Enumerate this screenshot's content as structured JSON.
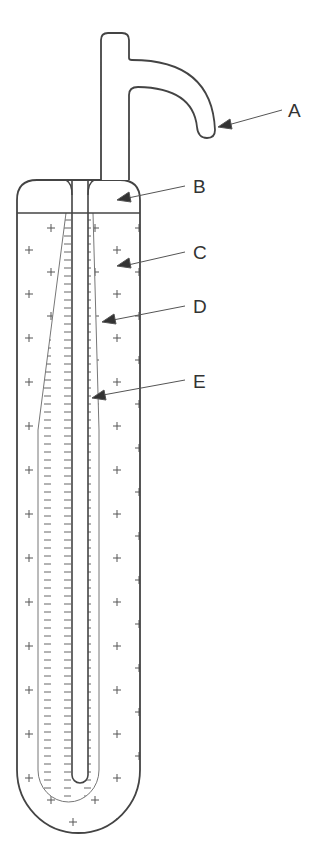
{
  "diagram": {
    "type": "labeled-apparatus",
    "labels": [
      {
        "id": "A",
        "text": "A",
        "x": 288,
        "y": 101,
        "target": "curved outlet tube"
      },
      {
        "id": "B",
        "text": "B",
        "x": 193,
        "y": 177,
        "target": "upper cap chamber"
      },
      {
        "id": "C",
        "text": "C",
        "x": 193,
        "y": 243,
        "target": "outer fluid region (plus signs)"
      },
      {
        "id": "D",
        "text": "D",
        "x": 193,
        "y": 297,
        "target": "boundary line between regions"
      },
      {
        "id": "E",
        "text": "E",
        "x": 193,
        "y": 372,
        "target": "inner fluid region (minus signs)"
      }
    ],
    "symbols": {
      "outer_region": "+",
      "inner_region": "−"
    },
    "colors": {
      "stroke": "#444444",
      "fine_stroke": "#777777",
      "text": "#333333",
      "background": "#ffffff"
    }
  }
}
